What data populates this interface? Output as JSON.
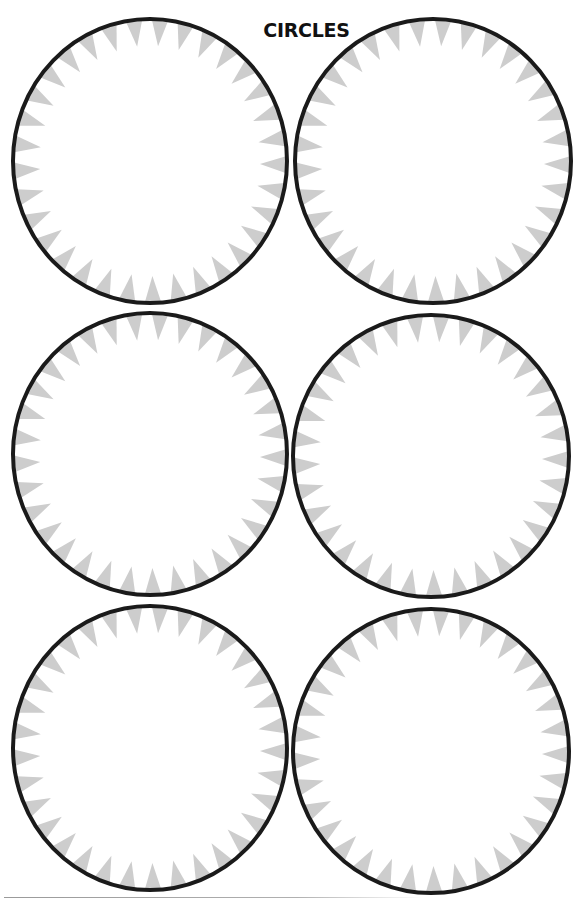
{
  "page": {
    "title": "CIRCLES"
  },
  "style": {
    "outline_color": "#1a1a1a",
    "tooth_color": "#cdcdcd",
    "background": "#ffffff",
    "outline_width": 4,
    "teeth_per_circle": 33,
    "tooth_depth": 26
  },
  "circles": [
    {
      "id": 1,
      "cx": 150,
      "cy": 161,
      "rx": 137,
      "ry": 142
    },
    {
      "id": 2,
      "cx": 433,
      "cy": 161,
      "rx": 138,
      "ry": 142
    },
    {
      "id": 3,
      "cx": 150,
      "cy": 454,
      "rx": 137,
      "ry": 141
    },
    {
      "id": 4,
      "cx": 431,
      "cy": 456,
      "rx": 138,
      "ry": 141
    },
    {
      "id": 5,
      "cx": 150,
      "cy": 748,
      "rx": 137,
      "ry": 142
    },
    {
      "id": 6,
      "cx": 431,
      "cy": 751,
      "rx": 138,
      "ry": 142
    }
  ]
}
